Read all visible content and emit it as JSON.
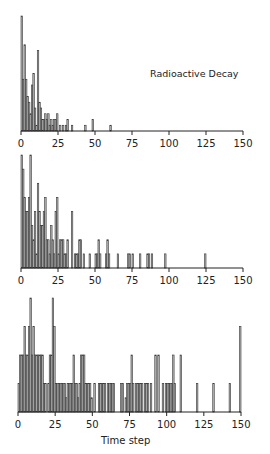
{
  "chart_data": [
    {
      "type": "bar",
      "title": "Radioactive Decay",
      "xlabel": "",
      "ylabel": "",
      "xlim": [
        0,
        150
      ],
      "xticks": [
        0,
        25,
        50,
        75,
        100,
        125,
        150
      ],
      "grid": false,
      "max_value": 20,
      "x": [
        1,
        2,
        3,
        4,
        5,
        6,
        7,
        8,
        9,
        10,
        11,
        12,
        13,
        14,
        15,
        16,
        17,
        18,
        19,
        20,
        21,
        22,
        23,
        24,
        25,
        27,
        29,
        31,
        32,
        35,
        44,
        49,
        61
      ],
      "values": [
        20,
        9,
        15,
        9,
        6,
        5,
        3,
        8,
        10,
        4,
        1,
        14,
        5,
        4,
        2,
        2,
        3,
        2,
        3,
        1,
        2,
        1,
        2,
        2,
        3,
        1,
        1,
        1,
        2,
        1,
        1,
        2,
        1
      ]
    },
    {
      "type": "bar",
      "title": "",
      "xlabel": "",
      "ylabel": "",
      "xlim": [
        0,
        150
      ],
      "xticks": [
        0,
        25,
        50,
        75,
        100,
        125,
        150
      ],
      "grid": false,
      "max_value": 8,
      "x": [
        1,
        2,
        3,
        4,
        5,
        6,
        7,
        8,
        9,
        10,
        11,
        12,
        13,
        14,
        15,
        16,
        17,
        18,
        19,
        20,
        21,
        22,
        23,
        24,
        25,
        26,
        27,
        28,
        29,
        30,
        31,
        32,
        35,
        37,
        38,
        39,
        40,
        41,
        43,
        47,
        51,
        52,
        53,
        54,
        58,
        59,
        60,
        66,
        73,
        74,
        76,
        81,
        86,
        87,
        89,
        98,
        125
      ],
      "values": [
        8,
        7,
        5,
        4,
        4,
        5,
        8,
        3,
        2,
        4,
        1,
        6,
        4,
        3,
        3,
        4,
        5,
        2,
        2,
        1,
        3,
        2,
        1,
        4,
        5,
        1,
        2,
        2,
        2,
        1,
        1,
        2,
        4,
        1,
        1,
        1,
        2,
        2,
        1,
        1,
        1,
        1,
        2,
        1,
        1,
        2,
        1,
        1,
        1,
        1,
        1,
        1,
        1,
        1,
        1,
        1,
        1
      ]
    },
    {
      "type": "bar",
      "title": "",
      "xlabel": "Time step",
      "ylabel": "",
      "xlim": [
        0,
        150
      ],
      "xticks": [
        0,
        25,
        50,
        75,
        100,
        125,
        150
      ],
      "grid": false,
      "max_value": 4,
      "x": [
        1,
        2,
        3,
        4,
        5,
        6,
        7,
        8,
        9,
        10,
        11,
        12,
        13,
        14,
        15,
        16,
        17,
        18,
        19,
        21,
        22,
        23,
        24,
        25,
        26,
        27,
        28,
        29,
        30,
        31,
        32,
        33,
        34,
        35,
        36,
        37,
        38,
        39,
        40,
        41,
        42,
        43,
        44,
        45,
        46,
        47,
        48,
        49,
        50,
        52,
        55,
        56,
        57,
        58,
        59,
        61,
        62,
        63,
        64,
        65,
        70,
        71,
        73,
        74,
        75,
        76,
        77,
        78,
        80,
        81,
        82,
        83,
        84,
        86,
        87,
        88,
        90,
        93,
        95,
        98,
        100,
        101,
        102,
        103,
        104,
        105,
        106,
        110,
        121,
        132,
        143,
        150
      ],
      "values": [
        1,
        2,
        2,
        2,
        3,
        2,
        2,
        3,
        4,
        2,
        3,
        2,
        2,
        2,
        2,
        2,
        2,
        1,
        1,
        1,
        2,
        2,
        4,
        3,
        1,
        1,
        1,
        1,
        1,
        1,
        1,
        0.5,
        1,
        1,
        1,
        1,
        2,
        1,
        1,
        0.5,
        1,
        2,
        2,
        2,
        1,
        1,
        1,
        1,
        0.5,
        1,
        1,
        1,
        1,
        1,
        1,
        1,
        1,
        1,
        1,
        1,
        1,
        1,
        0.5,
        1,
        1,
        1,
        2,
        1,
        1,
        1,
        1,
        1,
        1,
        1,
        1,
        1,
        1,
        2,
        2,
        1,
        1,
        1,
        1,
        1,
        1,
        2,
        1,
        2,
        1,
        1,
        1,
        3
      ]
    }
  ],
  "panels": [
    {
      "title": "Radioactive Decay",
      "xlabel": ""
    },
    {
      "title": "",
      "xlabel": ""
    },
    {
      "title": "",
      "xlabel": "Time step"
    }
  ],
  "tick_labels": [
    "0",
    "25",
    "50",
    "75",
    "100",
    "125",
    "150"
  ]
}
